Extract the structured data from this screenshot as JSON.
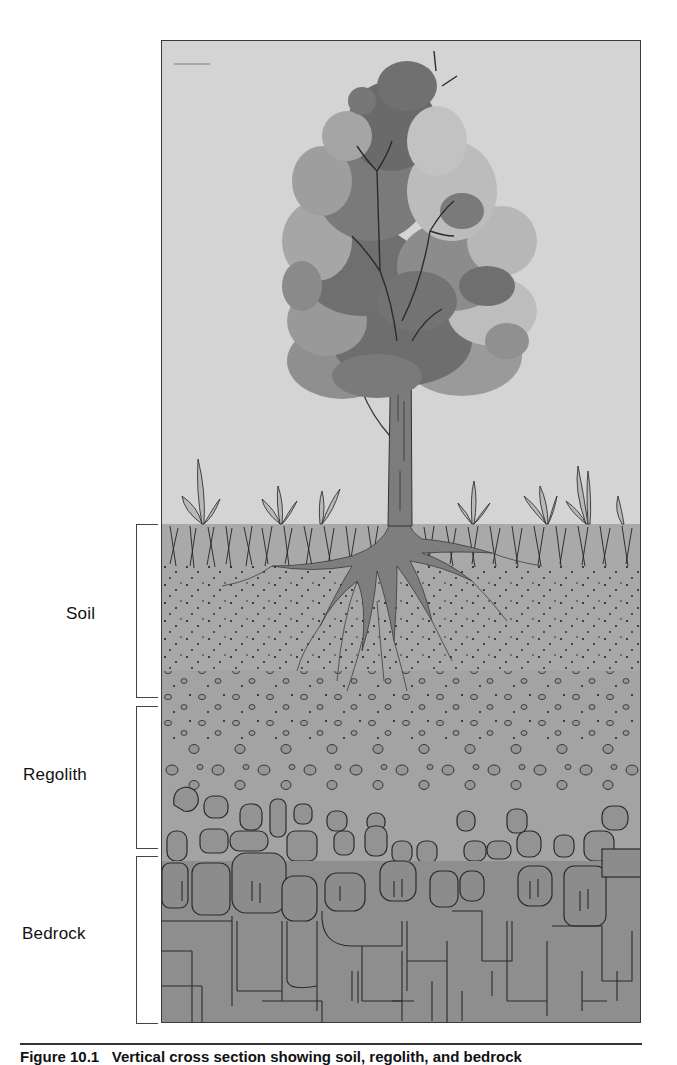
{
  "figure": {
    "colors": {
      "sky": "#d4d4d4",
      "grass_band": "#a9a9a9",
      "soil": "#a6a6a6",
      "regolith": "#a2a2a2",
      "rock": "#8f8f8f",
      "bedrock": "#8c8c8c",
      "outline": "#2b2b2b",
      "canopy_dark": "#6e6e6e",
      "canopy_mid": "#8f8f8f",
      "canopy_light": "#b3b3b3",
      "trunk": "#7c7c7c"
    },
    "layers": [
      {
        "id": "soil",
        "label": "Soil",
        "top_px": 524,
        "bottom_px": 697
      },
      {
        "id": "regolith",
        "label": "Regolith",
        "top_px": 706,
        "bottom_px": 848
      },
      {
        "id": "bedrock",
        "label": "Bedrock",
        "top_px": 856,
        "bottom_px": 1023
      }
    ],
    "ground_line_px": 523
  },
  "caption": {
    "number": "Figure 10.1",
    "text": "Vertical cross section showing soil, regolith, and bedrock"
  }
}
